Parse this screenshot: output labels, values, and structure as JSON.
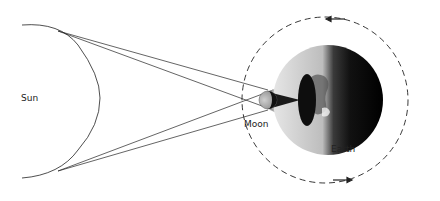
{
  "diagram": {
    "labels": {
      "sun": "Sun",
      "moon": "Moon",
      "earth": "Earth"
    },
    "orbit_direction": "counterclockwise",
    "colors": {
      "background": "#ffffff",
      "line": "#222222",
      "earth_light": "#d8d8d8",
      "earth_dark": "#111111",
      "shadow_cone": "#9a9a9a",
      "umbra": "#1a1a1a"
    }
  }
}
